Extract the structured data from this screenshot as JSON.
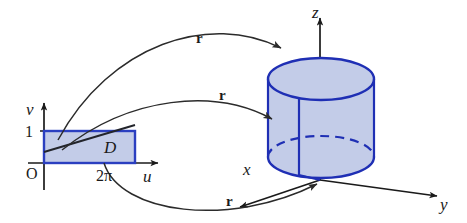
{
  "figure": {
    "background_color": "#ffffff",
    "width": 467,
    "height": 223
  },
  "colors": {
    "region_fill": "#c3cce8",
    "region_stroke": "#2b3fc0",
    "surface_fill": "#c3cce8",
    "surface_stroke": "#1f2fb4",
    "axis_stroke": "#1a1a1a",
    "arrow_stroke": "#2b2b2b",
    "text": "#1a1a1a"
  },
  "domain_plot": {
    "name": "uv-parameter-plane",
    "origin_label": "O",
    "horizontal_axis_label": "u",
    "vertical_axis_label": "v",
    "vertical_tick_label": "1",
    "horizontal_tick_label": "2π",
    "region_label": "D",
    "region": {
      "u_min": 0,
      "u_max": 6.283185307179586,
      "v_min": 0,
      "v_max": 1
    }
  },
  "surface_plot": {
    "name": "xyz-space-cylinder",
    "x_axis_label": "x",
    "y_axis_label": "y",
    "z_axis_label": "z",
    "shape": "cylinder"
  },
  "mappings": [
    {
      "id": "map-top",
      "label": "r",
      "description": "maps top edge of D to top rim of cylinder"
    },
    {
      "id": "map-middle",
      "label": "r",
      "description": "maps interior of D to lateral surface of cylinder"
    },
    {
      "id": "map-bottom",
      "label": "r",
      "description": "maps bottom edge of D to base of cylinder"
    }
  ]
}
